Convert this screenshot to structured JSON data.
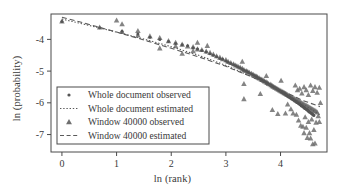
{
  "chart_data": {
    "type": "scatter",
    "title": "",
    "xlabel": "ln (rank)",
    "ylabel": "ln (probability)",
    "xlim": [
      -0.2,
      4.85
    ],
    "ylim": [
      -7.55,
      -3.2
    ],
    "xticks": [
      0,
      1,
      2,
      3,
      4
    ],
    "xticklabels": [
      "0",
      "1",
      "2",
      "3",
      "4"
    ],
    "yticks": [
      -4,
      -5,
      -6,
      -7
    ],
    "yticklabels": [
      "-4",
      "-5",
      "-6",
      "-7"
    ],
    "grid": false,
    "legend_position": "lower-left-inside",
    "marker_color": "#6f6f6f",
    "line_color": "#5a5a5a",
    "frame_color": "#444444",
    "series": [
      {
        "name": "Whole document observed",
        "type": "scatter",
        "marker": "dot",
        "points": [
          [
            0.0,
            -3.44
          ],
          [
            0.69,
            -3.63
          ],
          [
            1.1,
            -3.74
          ],
          [
            1.39,
            -3.83
          ],
          [
            1.61,
            -3.93
          ],
          [
            1.79,
            -4.0
          ],
          [
            1.95,
            -4.07
          ],
          [
            2.08,
            -4.13
          ],
          [
            2.2,
            -4.17
          ],
          [
            2.3,
            -4.2
          ],
          [
            2.4,
            -4.26
          ],
          [
            2.48,
            -4.3
          ],
          [
            2.56,
            -4.35
          ],
          [
            2.64,
            -4.4
          ],
          [
            2.71,
            -4.45
          ],
          [
            2.77,
            -4.5
          ],
          [
            2.83,
            -4.55
          ],
          [
            2.89,
            -4.6
          ],
          [
            2.94,
            -4.63
          ],
          [
            3.0,
            -4.68
          ],
          [
            3.04,
            -4.72
          ],
          [
            3.09,
            -4.76
          ],
          [
            3.14,
            -4.8
          ],
          [
            3.18,
            -4.83
          ],
          [
            3.22,
            -4.87
          ],
          [
            3.26,
            -4.9
          ],
          [
            3.3,
            -4.94
          ],
          [
            3.33,
            -4.97
          ],
          [
            3.37,
            -5.0
          ],
          [
            3.4,
            -5.03
          ],
          [
            3.43,
            -5.06
          ],
          [
            3.47,
            -5.09
          ],
          [
            3.5,
            -5.12
          ],
          [
            3.53,
            -5.15
          ],
          [
            3.56,
            -5.18
          ],
          [
            3.58,
            -5.2
          ],
          [
            3.61,
            -5.23
          ],
          [
            3.64,
            -5.26
          ],
          [
            3.66,
            -5.28
          ],
          [
            3.69,
            -5.31
          ],
          [
            3.71,
            -5.33
          ],
          [
            3.74,
            -5.36
          ],
          [
            3.76,
            -5.38
          ],
          [
            3.78,
            -5.41
          ],
          [
            3.81,
            -5.43
          ],
          [
            3.83,
            -5.45
          ],
          [
            3.85,
            -5.48
          ],
          [
            3.87,
            -5.5
          ],
          [
            3.89,
            -5.52
          ],
          [
            3.91,
            -5.54
          ],
          [
            3.93,
            -5.56
          ],
          [
            3.95,
            -5.58
          ],
          [
            3.97,
            -5.6
          ],
          [
            3.99,
            -5.62
          ],
          [
            4.01,
            -5.64
          ],
          [
            4.03,
            -5.66
          ],
          [
            4.04,
            -5.68
          ],
          [
            4.06,
            -5.7
          ],
          [
            4.08,
            -5.72
          ],
          [
            4.1,
            -5.74
          ],
          [
            4.11,
            -5.76
          ],
          [
            4.13,
            -5.78
          ],
          [
            4.14,
            -5.8
          ],
          [
            4.16,
            -5.81
          ],
          [
            4.17,
            -5.83
          ],
          [
            4.19,
            -5.85
          ],
          [
            4.2,
            -5.87
          ],
          [
            4.22,
            -5.88
          ],
          [
            4.23,
            -5.9
          ],
          [
            4.25,
            -5.92
          ],
          [
            4.26,
            -5.94
          ],
          [
            4.28,
            -5.95
          ],
          [
            4.29,
            -5.97
          ],
          [
            4.3,
            -5.99
          ],
          [
            4.32,
            -6.0
          ],
          [
            4.33,
            -6.02
          ],
          [
            4.34,
            -6.04
          ],
          [
            4.36,
            -6.05
          ],
          [
            4.37,
            -6.07
          ],
          [
            4.38,
            -6.09
          ],
          [
            4.39,
            -6.1
          ],
          [
            4.41,
            -6.12
          ],
          [
            4.42,
            -6.13
          ],
          [
            4.43,
            -6.15
          ],
          [
            4.44,
            -6.17
          ],
          [
            4.45,
            -6.18
          ],
          [
            4.47,
            -6.2
          ],
          [
            4.48,
            -6.21
          ],
          [
            4.49,
            -6.23
          ],
          [
            4.5,
            -6.24
          ],
          [
            4.51,
            -6.26
          ],
          [
            4.52,
            -6.28
          ],
          [
            4.53,
            -6.29
          ],
          [
            4.55,
            -6.31
          ],
          [
            4.56,
            -6.32
          ],
          [
            4.57,
            -6.34
          ],
          [
            4.58,
            -6.35
          ],
          [
            4.59,
            -6.37
          ],
          [
            4.6,
            -6.38
          ],
          [
            4.61,
            -6.4
          ]
        ]
      },
      {
        "name": "Whole document estimated",
        "type": "line",
        "linestyle": "dotted",
        "points": [
          [
            0.0,
            -3.36
          ],
          [
            0.5,
            -3.56
          ],
          [
            1.0,
            -3.77
          ],
          [
            1.5,
            -3.99
          ],
          [
            2.0,
            -4.23
          ],
          [
            2.5,
            -4.5
          ],
          [
            3.0,
            -4.82
          ],
          [
            3.5,
            -5.2
          ],
          [
            4.0,
            -5.64
          ],
          [
            4.4,
            -6.03
          ],
          [
            4.72,
            -6.38
          ]
        ]
      },
      {
        "name": "Window 40000 observed",
        "type": "scatter",
        "marker": "triangle",
        "points": [
          [
            0.0,
            -3.43
          ],
          [
            0.69,
            -3.62
          ],
          [
            1.1,
            -3.52
          ],
          [
            1.1,
            -3.76
          ],
          [
            1.39,
            -3.73
          ],
          [
            1.39,
            -3.87
          ],
          [
            1.61,
            -3.9
          ],
          [
            1.79,
            -3.95
          ],
          [
            1.79,
            -4.28
          ],
          [
            1.95,
            -4.05
          ],
          [
            2.08,
            -4.1
          ],
          [
            2.08,
            -4.21
          ],
          [
            2.2,
            -4.16
          ],
          [
            2.3,
            -4.22
          ],
          [
            2.4,
            -4.24
          ],
          [
            2.4,
            -4.37
          ],
          [
            2.48,
            -4.1
          ],
          [
            2.48,
            -4.31
          ],
          [
            2.56,
            -4.33
          ],
          [
            2.64,
            -4.38
          ],
          [
            2.71,
            -4.42
          ],
          [
            2.77,
            -4.47
          ],
          [
            2.83,
            -4.53
          ],
          [
            2.89,
            -4.57
          ],
          [
            2.94,
            -4.62
          ],
          [
            3.0,
            -4.65
          ],
          [
            3.04,
            -4.7
          ],
          [
            3.09,
            -4.74
          ],
          [
            3.14,
            -4.78
          ],
          [
            3.18,
            -4.82
          ],
          [
            3.22,
            -4.85
          ],
          [
            3.26,
            -4.88
          ],
          [
            3.3,
            -4.7
          ],
          [
            3.3,
            -4.92
          ],
          [
            3.33,
            -4.96
          ],
          [
            3.33,
            -5.88
          ],
          [
            3.37,
            -4.99
          ],
          [
            3.4,
            -5.02
          ],
          [
            3.43,
            -5.05
          ],
          [
            3.47,
            -5.08
          ],
          [
            3.5,
            -5.11
          ],
          [
            3.53,
            -5.14
          ],
          [
            3.56,
            -5.17
          ],
          [
            3.58,
            -5.19
          ],
          [
            3.61,
            -5.22
          ],
          [
            3.64,
            -5.25
          ],
          [
            3.66,
            -5.27
          ],
          [
            3.69,
            -5.3
          ],
          [
            3.71,
            -5.32
          ],
          [
            3.74,
            -5.15
          ],
          [
            3.74,
            -5.35
          ],
          [
            3.76,
            -5.37
          ],
          [
            3.78,
            -5.4
          ],
          [
            3.81,
            -5.42
          ],
          [
            3.83,
            -5.44
          ],
          [
            3.85,
            -5.47
          ],
          [
            3.85,
            -6.22
          ],
          [
            3.87,
            -5.49
          ],
          [
            3.89,
            -5.51
          ],
          [
            3.91,
            -5.53
          ],
          [
            3.93,
            -5.55
          ],
          [
            3.95,
            -5.57
          ],
          [
            3.95,
            -6.35
          ],
          [
            3.97,
            -5.59
          ],
          [
            3.99,
            -5.61
          ],
          [
            4.01,
            -5.3
          ],
          [
            4.01,
            -5.63
          ],
          [
            4.03,
            -5.65
          ],
          [
            4.05,
            -5.67
          ],
          [
            4.07,
            -5.69
          ],
          [
            4.09,
            -5.71
          ],
          [
            4.09,
            -6.33
          ],
          [
            4.11,
            -5.73
          ],
          [
            4.13,
            -5.75
          ],
          [
            4.13,
            -6.05
          ],
          [
            4.15,
            -5.77
          ],
          [
            4.17,
            -5.79
          ],
          [
            4.19,
            -5.81
          ],
          [
            4.19,
            -6.2
          ],
          [
            4.21,
            -5.83
          ],
          [
            4.23,
            -5.85
          ],
          [
            4.23,
            -6.33
          ],
          [
            4.25,
            -5.87
          ],
          [
            4.27,
            -5.45
          ],
          [
            4.27,
            -5.89
          ],
          [
            4.29,
            -5.91
          ],
          [
            4.29,
            -6.37
          ],
          [
            4.31,
            -5.6
          ],
          [
            4.31,
            -5.93
          ],
          [
            4.33,
            -5.95
          ],
          [
            4.33,
            -6.55
          ],
          [
            4.35,
            -5.55
          ],
          [
            4.35,
            -5.97
          ],
          [
            4.37,
            -5.99
          ],
          [
            4.37,
            -6.72
          ],
          [
            4.39,
            -5.7
          ],
          [
            4.39,
            -6.01
          ],
          [
            4.41,
            -6.03
          ],
          [
            4.41,
            -6.75
          ],
          [
            4.43,
            -5.5
          ],
          [
            4.43,
            -6.05
          ],
          [
            4.43,
            -6.95
          ],
          [
            4.45,
            -6.07
          ],
          [
            4.45,
            -6.45
          ],
          [
            4.47,
            -5.6
          ],
          [
            4.47,
            -6.09
          ],
          [
            4.47,
            -6.78
          ],
          [
            4.49,
            -6.11
          ],
          [
            4.49,
            -7.1
          ],
          [
            4.51,
            -5.75
          ],
          [
            4.51,
            -6.13
          ],
          [
            4.51,
            -6.6
          ],
          [
            4.53,
            -6.15
          ],
          [
            4.53,
            -6.95
          ],
          [
            4.55,
            -5.45
          ],
          [
            4.55,
            -6.17
          ],
          [
            4.55,
            -7.12
          ],
          [
            4.57,
            -6.19
          ],
          [
            4.57,
            -6.52
          ],
          [
            4.59,
            -5.62
          ],
          [
            4.59,
            -6.21
          ],
          [
            4.59,
            -7.3
          ],
          [
            4.61,
            -6.23
          ],
          [
            4.61,
            -6.85
          ],
          [
            4.63,
            -5.5
          ],
          [
            4.63,
            -6.25
          ],
          [
            4.63,
            -7.28
          ],
          [
            4.65,
            -6.27
          ],
          [
            4.65,
            -6.62
          ],
          [
            4.67,
            -5.68
          ],
          [
            4.67,
            -6.3
          ],
          [
            4.69,
            -6.42
          ],
          [
            4.71,
            -5.52
          ],
          [
            4.71,
            -6.6
          ],
          [
            4.73,
            -6.0
          ],
          [
            3.33,
            -5.4
          ],
          [
            3.63,
            -5.72
          ],
          [
            2.66,
            -4.2
          ],
          [
            2.2,
            -4.45
          ],
          [
            1.0,
            -3.4
          ]
        ]
      },
      {
        "name": "Window 40000 estimated",
        "type": "line",
        "linestyle": "dashed",
        "points": [
          [
            0.0,
            -3.3
          ],
          [
            0.5,
            -3.53
          ],
          [
            1.0,
            -3.77
          ],
          [
            1.5,
            -4.02
          ],
          [
            2.0,
            -4.28
          ],
          [
            2.5,
            -4.55
          ],
          [
            3.0,
            -4.85
          ],
          [
            3.5,
            -5.2
          ],
          [
            4.0,
            -5.6
          ],
          [
            4.4,
            -5.92
          ],
          [
            4.72,
            -6.12
          ]
        ]
      }
    ],
    "legend": [
      {
        "label": "Whole document observed",
        "marker": "dot"
      },
      {
        "label": "Whole document estimated",
        "marker": "dotted-line"
      },
      {
        "label": "Window 40000 observed",
        "marker": "triangle"
      },
      {
        "label": "Window 40000 estimated",
        "marker": "dashed-line"
      }
    ]
  }
}
